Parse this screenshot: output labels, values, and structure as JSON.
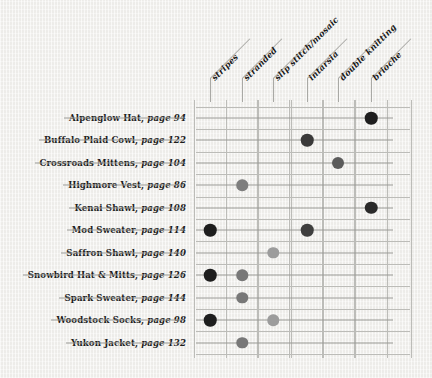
{
  "chart_data": {
    "type": "heatmap",
    "title": "",
    "xlabel": "",
    "ylabel": "",
    "grid": true,
    "legend": "none",
    "categories": [
      "stripes",
      "stranded",
      "slip stitch/mosaic",
      "intarsia",
      "double knitting",
      "brioche"
    ],
    "rows": [
      {
        "name": "Alpenglow Hat",
        "page_label": "page 94",
        "page": 94,
        "values": [
          0,
          0,
          0,
          0,
          0,
          3
        ],
        "marks": [
          {
            "category": "brioche",
            "col": 6,
            "shade": "dark",
            "color": "#1e1e1e"
          }
        ]
      },
      {
        "name": "Buffalo Plaid Cowl",
        "page_label": "page 122",
        "page": 122,
        "values": [
          0,
          0,
          0,
          3,
          0,
          0
        ],
        "marks": [
          {
            "category": "intarsia",
            "col": 4,
            "shade": "dark",
            "color": "#3a3a3a"
          }
        ]
      },
      {
        "name": "Crossroads Mittens",
        "page_label": "page 104",
        "page": 104,
        "values": [
          0,
          0,
          0,
          0,
          2,
          0
        ],
        "marks": [
          {
            "category": "double knitting",
            "col": 5,
            "shade": "medium-dark",
            "color": "#5c5c5c"
          }
        ]
      },
      {
        "name": "Highmore Vest",
        "page_label": "page 86",
        "page": 86,
        "values": [
          0,
          2,
          0,
          0,
          0,
          0
        ],
        "marks": [
          {
            "category": "stranded",
            "col": 2,
            "shade": "medium",
            "color": "#7e7e7e"
          }
        ]
      },
      {
        "name": "Kenai Shawl",
        "page_label": "page 108",
        "page": 108,
        "values": [
          0,
          0,
          0,
          0,
          0,
          3
        ],
        "marks": [
          {
            "category": "brioche",
            "col": 6,
            "shade": "dark",
            "color": "#2a2a2a"
          }
        ]
      },
      {
        "name": "Mod Sweater",
        "page_label": "page 114",
        "page": 114,
        "values": [
          3,
          0,
          0,
          3,
          0,
          0
        ],
        "marks": [
          {
            "category": "stripes",
            "col": 1,
            "shade": "dark",
            "color": "#1e1e1e"
          },
          {
            "category": "intarsia",
            "col": 4,
            "shade": "dark",
            "color": "#3f3f3f"
          }
        ]
      },
      {
        "name": "Saffron Shawl",
        "page_label": "page 140",
        "page": 140,
        "values": [
          0,
          0,
          1,
          0,
          0,
          0
        ],
        "marks": [
          {
            "category": "slip stitch/mosaic",
            "col": 3,
            "shade": "light",
            "color": "#9c9c9c"
          }
        ]
      },
      {
        "name": "Snowbird Hat & Mitts",
        "page_label": "page 126",
        "page": 126,
        "values": [
          3,
          2,
          0,
          0,
          0,
          0
        ],
        "marks": [
          {
            "category": "stripes",
            "col": 1,
            "shade": "dark",
            "color": "#1e1e1e"
          },
          {
            "category": "stranded",
            "col": 2,
            "shade": "medium",
            "color": "#787878"
          }
        ]
      },
      {
        "name": "Spark Sweater",
        "page_label": "page 144",
        "page": 144,
        "values": [
          0,
          2,
          0,
          0,
          0,
          0
        ],
        "marks": [
          {
            "category": "stranded",
            "col": 2,
            "shade": "medium",
            "color": "#787878"
          }
        ]
      },
      {
        "name": "Woodstock Socks",
        "page_label": "page 98",
        "page": 98,
        "values": [
          3,
          0,
          1,
          0,
          0,
          0
        ],
        "marks": [
          {
            "category": "stripes",
            "col": 1,
            "shade": "dark",
            "color": "#1e1e1e"
          },
          {
            "category": "slip stitch/mosaic",
            "col": 3,
            "shade": "light",
            "color": "#9c9c9c"
          }
        ]
      },
      {
        "name": "Yukon Jacket",
        "page_label": "page 132",
        "page": 132,
        "values": [
          0,
          2,
          0,
          0,
          0,
          0
        ],
        "marks": [
          {
            "category": "stranded",
            "col": 2,
            "shade": "medium",
            "color": "#787878"
          }
        ]
      }
    ]
  },
  "colors": {
    "background": "#f2f1ee",
    "grid_line": "#bcbcb8",
    "leader_line": "#9a9a96",
    "text": "#1b1b1b",
    "dot_dark": "#1e1e1e",
    "dot_medium_dark": "#5c5c5c",
    "dot_medium": "#7e7e7e",
    "dot_light": "#9c9c9c"
  }
}
